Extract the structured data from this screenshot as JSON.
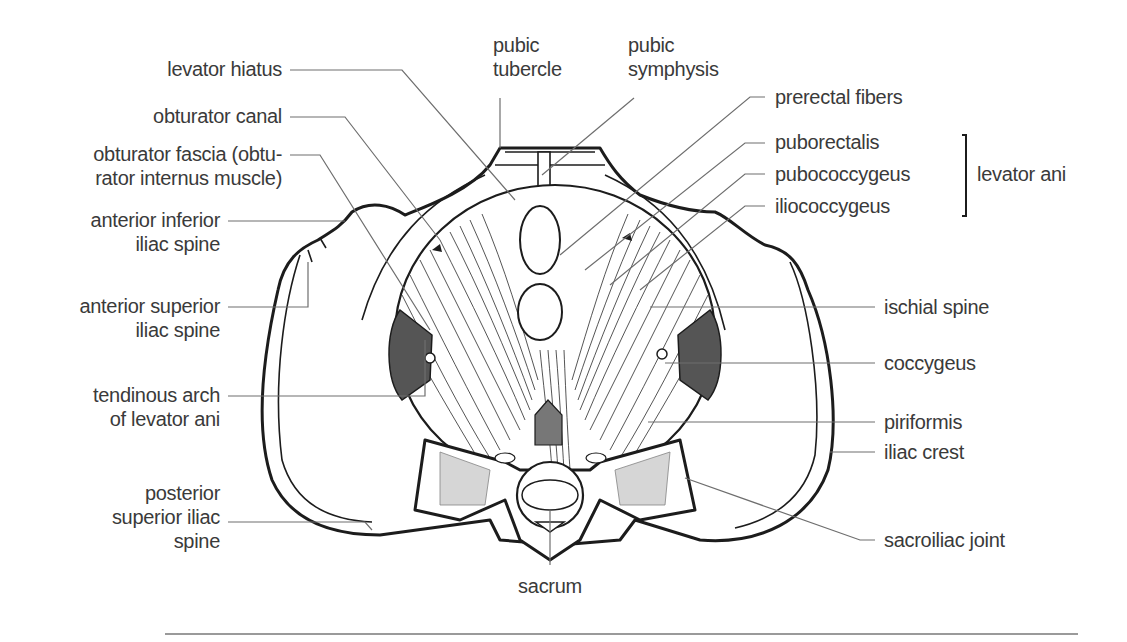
{
  "figure": {
    "labels_left": {
      "levator_hiatus": "levator hiatus",
      "obturator_canal": "obturator canal",
      "obturator_fascia_line1": "obturator fascia (obtu-",
      "obturator_fascia_line2": "rator internus muscle)",
      "aiis_line1": "anterior inferior",
      "aiis_line2": "iliac spine",
      "asis_line1": "anterior superior",
      "asis_line2": "iliac spine",
      "tendinous_arch_line1": "tendinous arch",
      "tendinous_arch_line2": "of levator ani",
      "psis_line1": "posterior",
      "psis_line2": "superior iliac",
      "psis_line3": "spine"
    },
    "labels_top": {
      "pubic_tubercle_line1": "pubic",
      "pubic_tubercle_line2": "tubercle",
      "pubic_symphysis_line1": "pubic",
      "pubic_symphysis_line2": "symphysis"
    },
    "labels_right": {
      "prerectal_fibers": "prerectal fibers",
      "puborectalis": "puborectalis",
      "pubococcygeus": "pubococcygeus",
      "iliococcygeus": "iliococcygeus",
      "group_label": "levator ani",
      "ischial_spine": "ischial spine",
      "coccygeus": "coccygeus",
      "piriformis": "piriformis",
      "iliac_crest": "iliac crest",
      "sacroiliac_joint": "sacroiliac joint"
    },
    "labels_bottom": {
      "sacrum": "sacrum"
    },
    "colors": {
      "text": "#3a3a3a",
      "leader": "#6e6e6e",
      "ink": "#1c1c1c",
      "rule": "#9a9a9a"
    }
  }
}
